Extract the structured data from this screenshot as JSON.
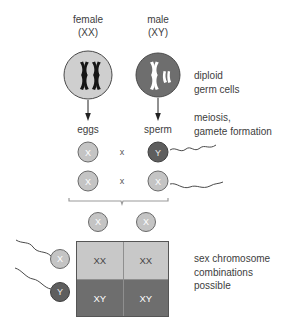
{
  "diagram": {
    "parents": [
      {
        "name": "female",
        "genotype": "(XX)",
        "cell_fill": "#cfcfcf",
        "chromosome_color": "#1a1a1a"
      },
      {
        "name": "male",
        "genotype": "(XY)",
        "cell_fill": "#6e6e6e",
        "chromosome_color": "#ffffff"
      }
    ],
    "stage_labels": {
      "eggs": "eggs",
      "sperm": "sperm"
    },
    "annotations": {
      "diploid": [
        "diploid",
        "germ cells"
      ],
      "meiosis": [
        "meiosis,",
        "gamete formation"
      ],
      "combinations": [
        "sex chromosome",
        "combinations",
        "possible"
      ]
    },
    "gamete_rows": [
      {
        "egg": "X",
        "operator": "x",
        "sperm": "Y",
        "sperm_type": "y"
      },
      {
        "egg": "X",
        "operator": "x",
        "sperm": "X",
        "sperm_type": "x"
      }
    ],
    "punnett": {
      "top_gametes": [
        "X",
        "X"
      ],
      "left_gametes": [
        {
          "label": "X",
          "type": "x"
        },
        {
          "label": "Y",
          "type": "y"
        }
      ],
      "cells": [
        {
          "value": "XX",
          "shade": "light"
        },
        {
          "value": "XX",
          "shade": "light"
        },
        {
          "value": "XY",
          "shade": "dark"
        },
        {
          "value": "XY",
          "shade": "dark"
        }
      ]
    },
    "colors": {
      "light_gray": "#c8c8c8",
      "dark_gray": "#6e6e6e",
      "text": "#3d3d3d",
      "stroke": "#4a4a4a"
    }
  }
}
